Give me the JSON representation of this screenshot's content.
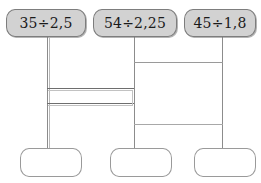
{
  "diagram": {
    "colors": {
      "top_box_fill": "#d2d2d2",
      "box_stroke": "#7d7d7d",
      "wire": "#8c8c8c",
      "background": "#ffffff",
      "text": "#1a1a1a"
    },
    "top_nodes": [
      {
        "id": "expr-1",
        "label": "35÷2,5"
      },
      {
        "id": "expr-2",
        "label": "54÷2,25"
      },
      {
        "id": "expr-3",
        "label": "45÷1,8"
      }
    ],
    "bottom_nodes": [
      {
        "id": "answer-1",
        "label": ""
      },
      {
        "id": "answer-2",
        "label": ""
      },
      {
        "id": "answer-3",
        "label": ""
      }
    ]
  }
}
